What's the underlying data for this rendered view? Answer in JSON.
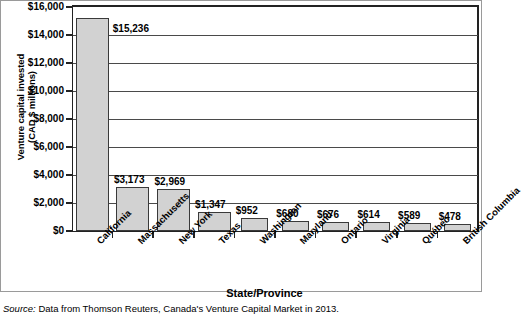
{
  "chart_data": {
    "type": "bar",
    "title": "",
    "xlabel": "State/Province",
    "ylabel": "Venture capital invested (CAD $ millions)",
    "ylabel_line1": "Venture capital invested",
    "ylabel_line2": "(CAD $ millions)",
    "ylim": [
      0,
      16000
    ],
    "ytick_step": 2000,
    "grid": true,
    "legend": false,
    "categories": [
      "California",
      "Massachusetts",
      "New York",
      "Texas",
      "Washington",
      "Maryland",
      "Ontario",
      "Virginia",
      "Québec",
      "British Columbia"
    ],
    "values": [
      15236,
      3173,
      2969,
      1347,
      952,
      680,
      676,
      614,
      589,
      478
    ],
    "value_labels": [
      "$15,236",
      "$3,173",
      "$2,969",
      "$1,347",
      "$952",
      "$680",
      "$676",
      "$614",
      "$589",
      "$478"
    ],
    "ytick_labels": [
      "$16,000",
      "$14,000",
      "$12,000",
      "$10,000",
      "$8,000",
      "$6,000",
      "$4,000",
      "$2,000",
      "$0"
    ],
    "ytick_values": [
      16000,
      14000,
      12000,
      10000,
      8000,
      6000,
      4000,
      2000,
      0
    ],
    "bar_fill_color": "#d2d2d2",
    "bar_edge_color": "#3a3a3a",
    "axis_color": "#222222",
    "grid_color": "#4a4a4a"
  },
  "source": {
    "label": "Source:",
    "text": " Data from Thomson Reuters, Canada's Venture Capital Market in 2013."
  }
}
